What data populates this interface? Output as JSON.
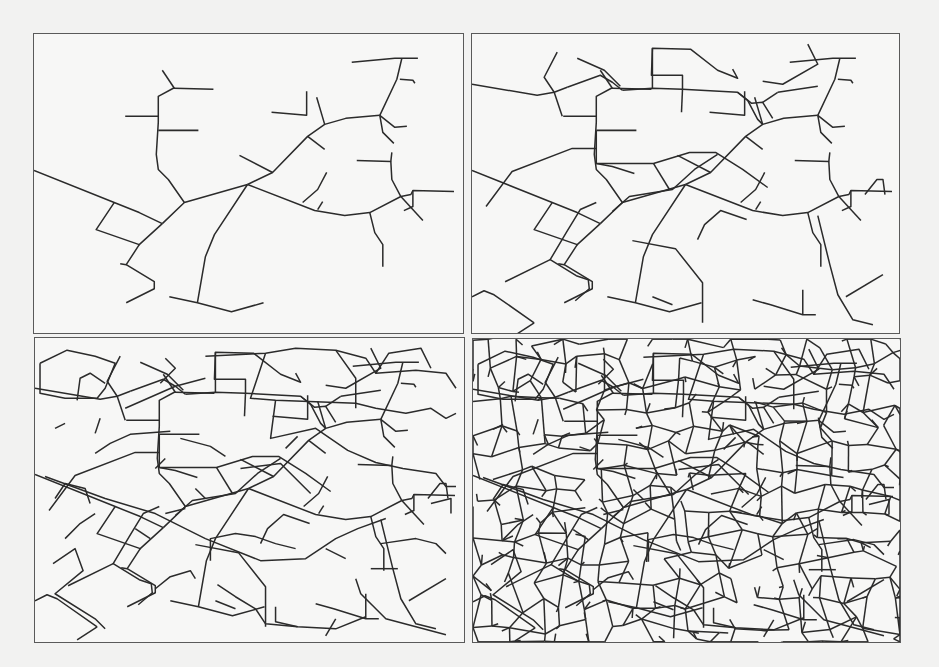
{
  "figure": {
    "colors": {
      "background": "#f2f2f1",
      "panel_fill": "#f7f7f6",
      "frame": "#5a5a5a",
      "crack": "#2b2b2b"
    },
    "panels": [
      {
        "id": "top-left",
        "stage": 1,
        "x": 33,
        "y": 33,
        "w": 431,
        "h": 301
      },
      {
        "id": "top-right",
        "stage": 2,
        "x": 471,
        "y": 33,
        "w": 429,
        "h": 301
      },
      {
        "id": "bottom-left",
        "stage": 3,
        "x": 34,
        "y": 337,
        "w": 431,
        "h": 306
      },
      {
        "id": "bottom-right",
        "stage": 4,
        "x": 472,
        "y": 338,
        "w": 429,
        "h": 305
      }
    ],
    "base_cracks": [
      [
        [
          0,
          136
        ],
        [
          80,
          168
        ],
        [
          105,
          178
        ],
        [
          128,
          189
        ]
      ],
      [
        [
          128,
          189
        ],
        [
          150,
          168
        ],
        [
          213,
          150
        ]
      ],
      [
        [
          213,
          150
        ],
        [
          180,
          200
        ],
        [
          171,
          222
        ],
        [
          163,
          268
        ]
      ],
      [
        [
          135,
          262
        ],
        [
          163,
          268
        ],
        [
          197,
          277
        ],
        [
          229,
          268
        ]
      ],
      [
        [
          213,
          150
        ],
        [
          238,
          138
        ],
        [
          273,
          102
        ],
        [
          290,
          90
        ],
        [
          311,
          84
        ],
        [
          345,
          81
        ]
      ],
      [
        [
          345,
          81
        ],
        [
          362,
          45
        ],
        [
          367,
          24
        ]
      ],
      [
        [
          317,
          28
        ],
        [
          360,
          24
        ],
        [
          383,
          24
        ]
      ],
      [
        [
          365,
          45
        ],
        [
          378,
          46
        ],
        [
          380,
          49
        ]
      ],
      [
        [
          213,
          150
        ],
        [
          280,
          176
        ],
        [
          310,
          181
        ],
        [
          335,
          178
        ],
        [
          366,
          162
        ]
      ],
      [
        [
          366,
          162
        ],
        [
          376,
          160
        ],
        [
          378,
          156
        ],
        [
          419,
          157
        ]
      ],
      [
        [
          378,
          156
        ],
        [
          378,
          172
        ],
        [
          369,
          176
        ]
      ],
      [
        [
          366,
          162
        ],
        [
          388,
          186
        ]
      ],
      [
        [
          345,
          81
        ],
        [
          360,
          93
        ],
        [
          372,
          92
        ]
      ],
      [
        [
          345,
          81
        ],
        [
          348,
          98
        ],
        [
          359,
          109
        ]
      ],
      [
        [
          322,
          126
        ],
        [
          356,
          127
        ],
        [
          357,
          118
        ]
      ],
      [
        [
          356,
          127
        ],
        [
          357,
          145
        ],
        [
          366,
          162
        ]
      ],
      [
        [
          292,
          138
        ],
        [
          283,
          155
        ],
        [
          268,
          168
        ]
      ],
      [
        [
          288,
          167
        ],
        [
          283,
          175
        ]
      ],
      [
        [
          335,
          178
        ],
        [
          340,
          198
        ],
        [
          348,
          210
        ],
        [
          348,
          232
        ]
      ],
      [
        [
          273,
          102
        ],
        [
          290,
          115
        ]
      ],
      [
        [
          290,
          90
        ],
        [
          282,
          63
        ]
      ],
      [
        [
          272,
          57
        ],
        [
          272,
          81
        ],
        [
          237,
          78
        ]
      ],
      [
        [
          238,
          138
        ],
        [
          205,
          121
        ]
      ],
      [
        [
          150,
          168
        ],
        [
          134,
          145
        ],
        [
          124,
          135
        ],
        [
          122,
          120
        ],
        [
          124,
          88
        ],
        [
          124,
          62
        ],
        [
          139,
          54
        ],
        [
          140,
          54
        ],
        [
          179,
          55
        ]
      ],
      [
        [
          140,
          54
        ],
        [
          128,
          36
        ]
      ],
      [
        [
          124,
          82
        ],
        [
          91,
          82
        ]
      ],
      [
        [
          124,
          96
        ],
        [
          164,
          96
        ]
      ],
      [
        [
          80,
          168
        ],
        [
          62,
          195
        ],
        [
          105,
          210
        ],
        [
          128,
          189
        ]
      ],
      [
        [
          105,
          210
        ],
        [
          92,
          230
        ],
        [
          86,
          229
        ]
      ],
      [
        [
          92,
          230
        ],
        [
          120,
          247
        ],
        [
          120,
          254
        ],
        [
          92,
          268
        ]
      ]
    ],
    "stage2_extra": [
      [
        [
          0,
          50
        ],
        [
          65,
          61
        ],
        [
          82,
          58
        ],
        [
          95,
          53
        ]
      ],
      [
        [
          82,
          58
        ],
        [
          72,
          43
        ],
        [
          85,
          18
        ]
      ],
      [
        [
          95,
          53
        ],
        [
          128,
          41
        ],
        [
          140,
          48
        ],
        [
          150,
          56
        ]
      ],
      [
        [
          105,
          24
        ],
        [
          132,
          36
        ],
        [
          148,
          52
        ]
      ],
      [
        [
          150,
          56
        ],
        [
          180,
          54
        ],
        [
          210,
          55
        ]
      ],
      [
        [
          180,
          54
        ],
        [
          180,
          14
        ],
        [
          218,
          15
        ],
        [
          245,
          36
        ],
        [
          265,
          44
        ],
        [
          260,
          35
        ]
      ],
      [
        [
          180,
          14
        ],
        [
          179,
          41
        ],
        [
          210,
          41
        ],
        [
          210,
          55
        ]
      ],
      [
        [
          210,
          55
        ],
        [
          209,
          78
        ]
      ],
      [
        [
          210,
          55
        ],
        [
          265,
          58
        ],
        [
          275,
          66
        ],
        [
          285,
          85
        ],
        [
          290,
          90
        ]
      ],
      [
        [
          265,
          58
        ],
        [
          279,
          69
        ],
        [
          290,
          68
        ],
        [
          300,
          84
        ]
      ],
      [
        [
          290,
          68
        ],
        [
          305,
          58
        ]
      ],
      [
        [
          124,
          96
        ],
        [
          124,
          129
        ],
        [
          140,
          132
        ],
        [
          162,
          139
        ]
      ],
      [
        [
          124,
          129
        ],
        [
          181,
          129
        ],
        [
          217,
          118
        ],
        [
          243,
          118
        ],
        [
          270,
          135
        ],
        [
          295,
          153
        ]
      ],
      [
        [
          181,
          129
        ],
        [
          197,
          155
        ]
      ],
      [
        [
          82,
          58
        ],
        [
          90,
          82
        ]
      ],
      [
        [
          14,
          172
        ],
        [
          40,
          137
        ],
        [
          100,
          114
        ],
        [
          124,
          114
        ]
      ],
      [
        [
          124,
          168
        ],
        [
          108,
          175
        ],
        [
          94,
          198
        ],
        [
          78,
          225
        ],
        [
          104,
          241
        ],
        [
          116,
          245
        ],
        [
          117,
          254
        ],
        [
          103,
          266
        ]
      ],
      [
        [
          78,
          225
        ],
        [
          33,
          247
        ]
      ],
      [
        [
          0,
          262
        ],
        [
          12,
          256
        ],
        [
          22,
          260
        ],
        [
          62,
          288
        ]
      ],
      [
        [
          62,
          288
        ],
        [
          42,
          301
        ]
      ],
      [
        [
          140,
          177
        ],
        [
          157,
          162
        ],
        [
          200,
          155
        ],
        [
          222,
          135
        ],
        [
          245,
          120
        ]
      ],
      [
        [
          160,
          206
        ],
        [
          203,
          214
        ],
        [
          230,
          248
        ],
        [
          230,
          288
        ]
      ],
      [
        [
          200,
          270
        ],
        [
          180,
          262
        ]
      ],
      [
        [
          280,
          265
        ],
        [
          298,
          270
        ],
        [
          330,
          280
        ],
        [
          343,
          280
        ]
      ],
      [
        [
          345,
          181
        ],
        [
          357,
          230
        ],
        [
          365,
          260
        ],
        [
          380,
          285
        ],
        [
          400,
          290
        ]
      ],
      [
        [
          330,
          280
        ],
        [
          330,
          255
        ]
      ],
      [
        [
          373,
          262
        ],
        [
          410,
          240
        ]
      ],
      [
        [
          392,
          160
        ],
        [
          404,
          145
        ],
        [
          410,
          145
        ],
        [
          412,
          160
        ]
      ],
      [
        [
          225,
          205
        ],
        [
          232,
          190
        ],
        [
          248,
          176
        ],
        [
          274,
          185
        ]
      ],
      [
        [
          305,
          58
        ],
        [
          325,
          55
        ],
        [
          345,
          52
        ]
      ],
      [
        [
          335,
          10
        ],
        [
          345,
          30
        ],
        [
          310,
          50
        ],
        [
          290,
          47
        ]
      ]
    ],
    "stage3_extra": [
      [
        [
          5,
          25
        ],
        [
          32,
          12
        ],
        [
          60,
          18
        ],
        [
          80,
          25
        ],
        [
          70,
          50
        ],
        [
          62,
          60
        ],
        [
          30,
          60
        ],
        [
          5,
          55
        ],
        [
          5,
          25
        ]
      ],
      [
        [
          42,
          62
        ],
        [
          45,
          40
        ],
        [
          55,
          35
        ],
        [
          70,
          45
        ]
      ],
      [
        [
          130,
          20
        ],
        [
          140,
          30
        ],
        [
          125,
          45
        ]
      ],
      [
        [
          170,
          18
        ],
        [
          230,
          15
        ],
        [
          260,
          10
        ],
        [
          300,
          12
        ],
        [
          330,
          20
        ],
        [
          340,
          35
        ],
        [
          380,
          32
        ],
        [
          410,
          35
        ],
        [
          420,
          50
        ]
      ],
      [
        [
          340,
          35
        ],
        [
          353,
          15
        ],
        [
          385,
          10
        ],
        [
          395,
          30
        ]
      ],
      [
        [
          230,
          15
        ],
        [
          215,
          60
        ],
        [
          240,
          62
        ],
        [
          320,
          65
        ],
        [
          340,
          70
        ],
        [
          370,
          75
        ],
        [
          395,
          70
        ],
        [
          410,
          80
        ],
        [
          420,
          75
        ]
      ],
      [
        [
          300,
          12
        ],
        [
          320,
          40
        ],
        [
          320,
          70
        ]
      ],
      [
        [
          240,
          62
        ],
        [
          235,
          100
        ],
        [
          280,
          90
        ],
        [
          312,
          112
        ],
        [
          340,
          124
        ],
        [
          367,
          130
        ],
        [
          400,
          135
        ],
        [
          410,
          148
        ],
        [
          420,
          148
        ]
      ],
      [
        [
          90,
          70
        ],
        [
          140,
          48
        ],
        [
          170,
          40
        ]
      ],
      [
        [
          60,
          115
        ],
        [
          75,
          105
        ],
        [
          95,
          96
        ],
        [
          135,
          93
        ]
      ],
      [
        [
          10,
          138
        ],
        [
          70,
          160
        ],
        [
          120,
          175
        ],
        [
          170,
          200
        ],
        [
          225,
          222
        ],
        [
          270,
          220
        ],
        [
          300,
          200
        ],
        [
          322,
          190
        ],
        [
          350,
          180
        ]
      ],
      [
        [
          20,
          160
        ],
        [
          30,
          145
        ],
        [
          50,
          150
        ],
        [
          55,
          165
        ]
      ],
      [
        [
          30,
          200
        ],
        [
          45,
          185
        ],
        [
          60,
          175
        ]
      ],
      [
        [
          18,
          225
        ],
        [
          40,
          210
        ],
        [
          48,
          232
        ],
        [
          20,
          255
        ],
        [
          60,
          280
        ],
        [
          70,
          290
        ]
      ],
      [
        [
          120,
          250
        ],
        [
          135,
          238
        ],
        [
          155,
          232
        ],
        [
          160,
          240
        ]
      ],
      [
        [
          175,
          222
        ],
        [
          175,
          200
        ],
        [
          200,
          195
        ],
        [
          220,
          198
        ],
        [
          240,
          205
        ],
        [
          260,
          210
        ]
      ],
      [
        [
          182,
          246
        ],
        [
          200,
          258
        ],
        [
          220,
          270
        ],
        [
          230,
          285
        ],
        [
          262,
          288
        ],
        [
          300,
          290
        ],
        [
          330,
          278
        ]
      ],
      [
        [
          240,
          268
        ],
        [
          240,
          283
        ],
        [
          262,
          288
        ]
      ],
      [
        [
          320,
          240
        ],
        [
          325,
          255
        ],
        [
          340,
          270
        ],
        [
          350,
          280
        ],
        [
          380,
          288
        ],
        [
          410,
          296
        ]
      ],
      [
        [
          300,
          280
        ],
        [
          290,
          297
        ]
      ],
      [
        [
          345,
          205
        ],
        [
          380,
          200
        ],
        [
          400,
          205
        ],
        [
          410,
          215
        ]
      ],
      [
        [
          395,
          165
        ],
        [
          415,
          160
        ],
        [
          415,
          175
        ]
      ],
      [
        [
          205,
          130
        ],
        [
          245,
          125
        ],
        [
          260,
          140
        ],
        [
          275,
          155
        ]
      ],
      [
        [
          250,
          110
        ],
        [
          262,
          98
        ]
      ],
      [
        [
          145,
          100
        ],
        [
          175,
          108
        ],
        [
          190,
          118
        ]
      ],
      [
        [
          160,
          150
        ],
        [
          170,
          160
        ]
      ],
      [
        [
          100,
          190
        ],
        [
          115,
          200
        ]
      ],
      [
        [
          60,
          95
        ],
        [
          65,
          80
        ]
      ],
      [
        [
          150,
          170
        ],
        [
          130,
          175
        ]
      ],
      [
        [
          290,
          210
        ],
        [
          310,
          220
        ]
      ],
      [
        [
          335,
          230
        ],
        [
          362,
          230
        ]
      ],
      [
        [
          30,
          85
        ],
        [
          20,
          90
        ]
      ],
      [
        [
          120,
          130
        ],
        [
          130,
          120
        ]
      ]
    ],
    "stage4_density_grid": {
      "cell": 22,
      "jitter": 9,
      "seed": 7,
      "branch_prob": 0.55
    }
  }
}
